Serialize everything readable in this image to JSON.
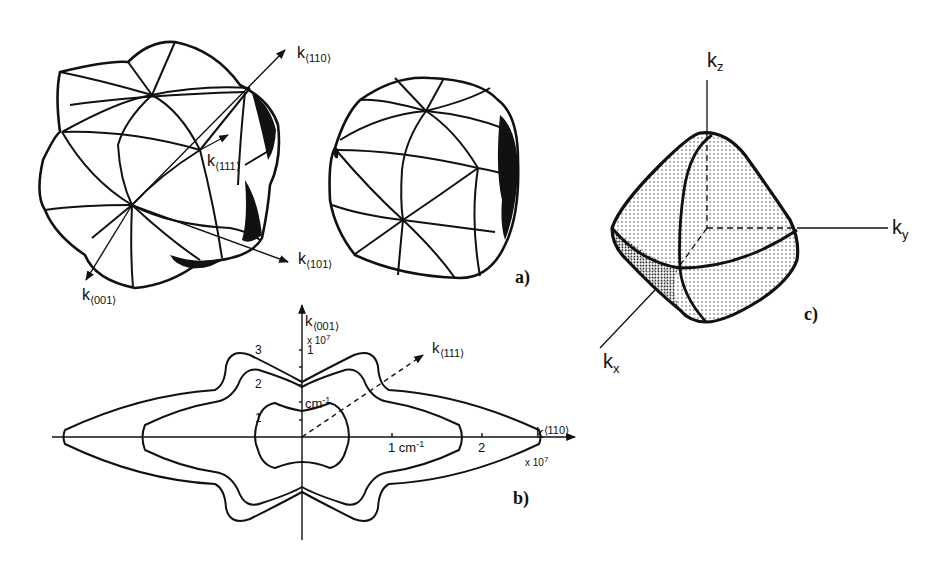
{
  "figure": {
    "panel_a": {
      "label": "a)",
      "axes": {
        "k110": {
          "base": "k",
          "sub": "⟨110⟩"
        },
        "k111": {
          "base": "k",
          "sub": "⟨111⟩"
        },
        "k101": {
          "base": "k",
          "sub": "⟨101⟩"
        },
        "k001": {
          "base": "k",
          "sub": "⟨001⟩"
        }
      }
    },
    "panel_b": {
      "label": "b)",
      "vertical_axis": {
        "base": "k",
        "sub": "⟨001⟩",
        "scale": "x 10",
        "exp": "7",
        "tick1": "1",
        "unit": "cm",
        "unit_exp": "-1"
      },
      "horizontal_axis": {
        "base": "k",
        "sub": "⟨110⟩",
        "scale": "x 10",
        "exp": "7",
        "tick1": "1 cm",
        "tick1_exp": "-1",
        "tick2": "2"
      },
      "diagonal_axis": {
        "base": "k",
        "sub": "⟨111⟩"
      },
      "curve_labels": [
        "1",
        "2",
        "3"
      ]
    },
    "panel_c": {
      "label": "c)",
      "axes": {
        "kz": {
          "base": "k",
          "sub": "z"
        },
        "ky": {
          "base": "k",
          "sub": "y"
        },
        "kx": {
          "base": "k",
          "sub": "x"
        }
      }
    }
  }
}
